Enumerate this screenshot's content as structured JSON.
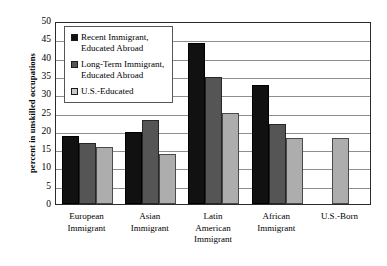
{
  "chart_data": {
    "type": "bar",
    "title": "",
    "subtitle": "",
    "xlabel": "",
    "ylabel": "percent in unskilled occupations",
    "ylim": [
      0,
      50
    ],
    "ytick_step": 5,
    "yticks": [
      "0",
      "5",
      "10",
      "15",
      "20",
      "25",
      "30",
      "35",
      "40",
      "45",
      "50"
    ],
    "grid": true,
    "legend_position": "upper-left inside plot area",
    "categories": [
      "European\nImmigrant",
      "Asian\nImmigrant",
      "Latin\nAmerican\nImmigrant",
      "African\nImmigrant",
      "U.S.-Born"
    ],
    "series": [
      {
        "name": "Recent Immigrant,\nEducated Abroad",
        "color": "#111111",
        "values": [
          18.7,
          19.8,
          44.0,
          32.5,
          null
        ]
      },
      {
        "name": "Long-Term Immigrant,\nEducated Abroad",
        "color": "#555555",
        "values": [
          16.7,
          23.0,
          34.7,
          21.8,
          null
        ]
      },
      {
        "name": "U.S.-Educated",
        "color": "#adadad",
        "values": [
          15.7,
          13.8,
          25.0,
          18.0,
          18.0
        ]
      }
    ]
  },
  "colors": {
    "series_recent": "#111111",
    "series_long_term": "#555555",
    "series_us_educated": "#adadad",
    "axis": "#2b2b2b",
    "gridline": "#8d8d8d",
    "background": "#ffffff"
  }
}
